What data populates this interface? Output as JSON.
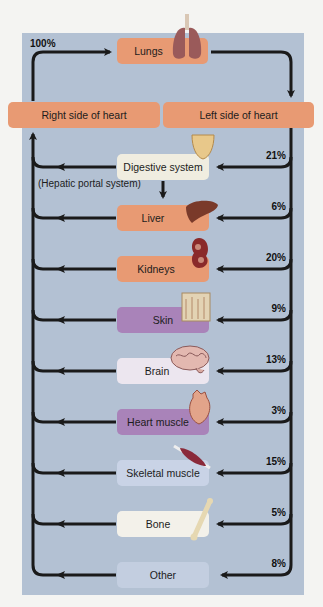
{
  "colors": {
    "panel_bg": "#b3c1d3",
    "arrow": "#1a1a1a",
    "orange": "#e89a73",
    "purple": "#a983b9",
    "pale": "#f0ede0",
    "light_blue": "#c9d3e6",
    "lavender": "#e6e2ee"
  },
  "top": {
    "lungs_label": "Lungs",
    "total_pct": "100%"
  },
  "heart": {
    "right_label": "Right side of heart",
    "left_label": "Left side of heart"
  },
  "hepatic_label": "(Hepatic portal system)",
  "organs": [
    {
      "label": "Digestive system",
      "pct": "21%",
      "icon": "stomach-icon"
    },
    {
      "label": "Liver",
      "pct": "6%",
      "icon": "liver-icon"
    },
    {
      "label": "Kidneys",
      "pct": "20%",
      "icon": "kidney-icon"
    },
    {
      "label": "Skin",
      "pct": "9%",
      "icon": "skin-icon"
    },
    {
      "label": "Brain",
      "pct": "13%",
      "icon": "brain-icon"
    },
    {
      "label": "Heart muscle",
      "pct": "3%",
      "icon": "heart-icon"
    },
    {
      "label": "Skeletal muscle",
      "pct": "15%",
      "icon": "muscle-icon"
    },
    {
      "label": "Bone",
      "pct": "5%",
      "icon": "bone-icon"
    },
    {
      "label": "Other",
      "pct": "8%",
      "icon": ""
    }
  ]
}
